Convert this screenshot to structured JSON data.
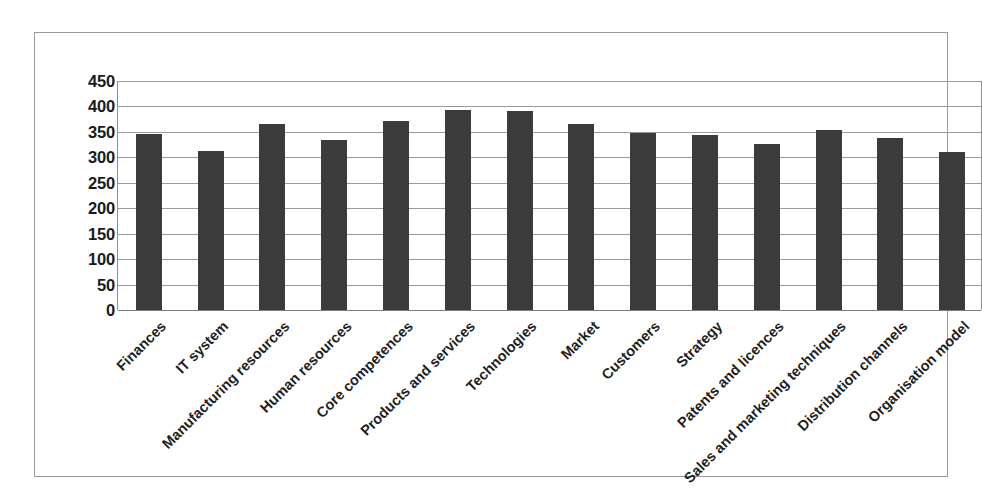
{
  "chart_data": {
    "type": "bar",
    "title": "",
    "subtitle": "",
    "xlabel": "",
    "ylabel": "",
    "ylim": [
      0,
      450
    ],
    "ytick_step": 50,
    "yticks": [
      "450",
      "400",
      "350",
      "300",
      "250",
      "200",
      "150",
      "100",
      "50",
      "0"
    ],
    "grid": true,
    "legend": false,
    "legend_position": "none",
    "bar_color": "#3b3b3b",
    "gridline_color": "#9b9b9b",
    "frame_color": "#9a9a9a",
    "categories": [
      "Finances",
      "IT system",
      "Manufacturing resources",
      "Human resources",
      "Core competences",
      "Products and services",
      "Technologies",
      "Market",
      "Customers",
      "Strategy",
      "Patents and licences",
      "Sales and marketing techniques",
      "Distribution channels",
      "Organisation model"
    ],
    "values": [
      345,
      313,
      365,
      334,
      372,
      394,
      392,
      366,
      348,
      343,
      326,
      353,
      338,
      311
    ]
  }
}
